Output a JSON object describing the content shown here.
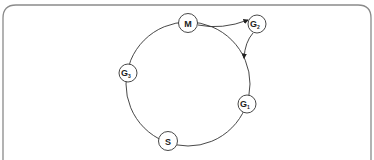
{
  "diagram": {
    "type": "ring",
    "frame": {
      "stroke": "#8a8a8a"
    },
    "ring": {
      "cx": 188,
      "cy": 84,
      "r": 62,
      "stroke": "#333333"
    },
    "nodes": [
      {
        "id": "M",
        "label": "M",
        "sub": "",
        "x": 188,
        "y": 23
      },
      {
        "id": "G2",
        "label": "G",
        "sub": "2",
        "x": 257,
        "y": 24
      },
      {
        "id": "G3",
        "label": "G",
        "sub": "3",
        "x": 128,
        "y": 73
      },
      {
        "id": "G1",
        "label": "G",
        "sub": "1",
        "x": 247,
        "y": 104
      },
      {
        "id": "S",
        "label": "S",
        "sub": "",
        "x": 168,
        "y": 141
      }
    ],
    "edges": [
      {
        "from": "M",
        "to": "G2",
        "arrow": true
      },
      {
        "from": "G2",
        "to": "ring",
        "arrow": true
      }
    ]
  }
}
